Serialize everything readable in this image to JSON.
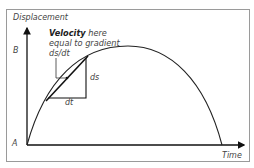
{
  "diagram": {
    "type": "displacement-time-graph",
    "y_axis_label": "Displacement",
    "x_axis_label": "Time",
    "y_ticks": {
      "b": "B",
      "a": "A"
    },
    "annotation": {
      "bold": "Velocity",
      "line1_rest": " here",
      "line2": "equal to gradient",
      "line3": "ds/dt"
    },
    "triangle_labels": {
      "ds": "ds",
      "dt": "dt"
    },
    "colors": {
      "line": "#1a1a1a",
      "frame": "#9a9a9a",
      "text": "#444444"
    }
  }
}
